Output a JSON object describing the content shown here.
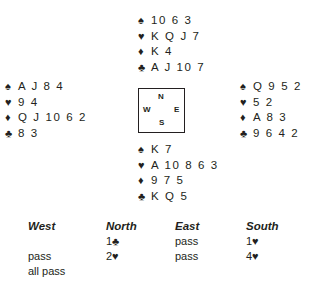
{
  "suits": {
    "spades": "♠",
    "hearts": "♥",
    "diamonds": "♦",
    "clubs": "♣"
  },
  "hands": {
    "north": {
      "spades": "10 6 3",
      "hearts": "K Q J 7",
      "diamonds": "K 4",
      "clubs": "A J 10 7"
    },
    "west": {
      "spades": "A J 8 4",
      "hearts": "9 4",
      "diamonds": "Q J 10 6 2",
      "clubs": "8 3"
    },
    "east": {
      "spades": "Q 9 5 2",
      "hearts": "5 2",
      "diamonds": "A 8 3",
      "clubs": "9 6 4 2"
    },
    "south": {
      "spades": "K 7",
      "hearts": "A 10 8 6 3",
      "diamonds": "9 7 5",
      "clubs": "K Q 5"
    }
  },
  "compass": {
    "n": "N",
    "w": "W",
    "e": "E",
    "s": "S"
  },
  "auction": {
    "headers": {
      "west": "West",
      "north": "North",
      "east": "East",
      "south": "South"
    },
    "west": [
      "",
      "pass",
      "all pass"
    ],
    "north": [
      "1♣",
      "2♥"
    ],
    "east": [
      "pass",
      "pass"
    ],
    "south": [
      "1♥",
      "4♥"
    ]
  }
}
